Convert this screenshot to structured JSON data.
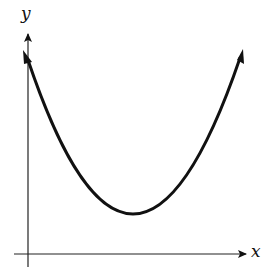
{
  "diagram": {
    "type": "function-graph",
    "axes": {
      "x_label": "x",
      "y_label": "y"
    },
    "curve": {
      "shape": "parabola-opening-upward",
      "vertex_position": "above x-axis, right of y-axis",
      "ends": "arrows"
    },
    "colors": {
      "stroke": "#111111",
      "background": "#ffffff"
    }
  }
}
